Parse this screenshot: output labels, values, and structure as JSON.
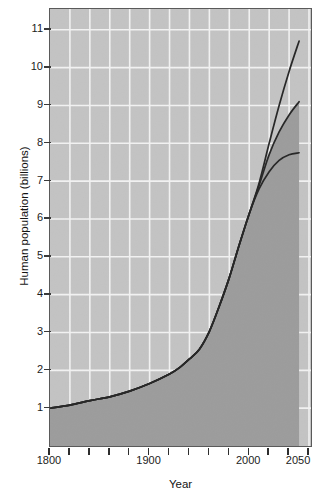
{
  "chart_data": {
    "type": "line",
    "title": "",
    "xlabel": "Year",
    "ylabel": "Human population (billions)",
    "xlim": [
      1800,
      2062
    ],
    "ylim": [
      0.0,
      11.55
    ],
    "grid": true,
    "legend": "none",
    "x_ticks": [
      1800,
      1820,
      1840,
      1860,
      1880,
      1900,
      1920,
      1940,
      1960,
      1980,
      2000,
      2020,
      2040,
      2060
    ],
    "x_tick_labels": [
      "1800",
      "",
      "",
      "",
      "",
      "1900",
      "",
      "",
      "",
      "",
      "2000",
      "",
      "",
      ""
    ],
    "x_major_labels": [
      {
        "value": 1800,
        "label": "1800"
      },
      {
        "value": 1900,
        "label": "1900"
      },
      {
        "value": 2000,
        "label": "2000"
      },
      {
        "value": 2050,
        "label": "2050"
      }
    ],
    "y_ticks": [
      1,
      2,
      3,
      4,
      5,
      6,
      7,
      8,
      9,
      10,
      11
    ],
    "y_tick_labels": [
      "1",
      "2",
      "3",
      "4",
      "5",
      "6",
      "7",
      "8",
      "9",
      "10",
      "11"
    ],
    "shaded_area": {
      "label": "area-under-historical-and-medium-curve",
      "color": "#9c9c9c"
    },
    "plot_background": "#c3c3c3",
    "gridline_color": "#f2f2f2",
    "line_color": "#262626",
    "projection_start_year": 2000,
    "series": [
      {
        "name": "high-projection",
        "end_year": 2050,
        "end_value": 10.7,
        "x": [
          1800,
          1820,
          1840,
          1860,
          1880,
          1900,
          1920,
          1930,
          1940,
          1950,
          1960,
          1970,
          1980,
          1990,
          2000,
          2010,
          2020,
          2030,
          2040,
          2050
        ],
        "y": [
          1.0,
          1.08,
          1.2,
          1.3,
          1.45,
          1.65,
          1.9,
          2.07,
          2.3,
          2.56,
          3.03,
          3.7,
          4.45,
          5.32,
          6.14,
          6.96,
          8.0,
          9.0,
          9.9,
          10.7
        ]
      },
      {
        "name": "medium-projection",
        "end_year": 2050,
        "end_value": 9.1,
        "x": [
          1800,
          1820,
          1840,
          1860,
          1880,
          1900,
          1920,
          1930,
          1940,
          1950,
          1960,
          1970,
          1980,
          1990,
          2000,
          2010,
          2020,
          2030,
          2040,
          2050
        ],
        "y": [
          1.0,
          1.08,
          1.2,
          1.3,
          1.45,
          1.65,
          1.9,
          2.07,
          2.3,
          2.56,
          3.03,
          3.7,
          4.45,
          5.32,
          6.14,
          6.9,
          7.7,
          8.3,
          8.75,
          9.1
        ]
      },
      {
        "name": "low-projection",
        "end_year": 2050,
        "end_value": 7.75,
        "x": [
          1800,
          1820,
          1840,
          1860,
          1880,
          1900,
          1920,
          1930,
          1940,
          1950,
          1960,
          1970,
          1980,
          1990,
          2000,
          2010,
          2020,
          2030,
          2040,
          2050
        ],
        "y": [
          1.0,
          1.08,
          1.2,
          1.3,
          1.45,
          1.65,
          1.9,
          2.07,
          2.3,
          2.56,
          3.03,
          3.7,
          4.45,
          5.32,
          6.14,
          6.8,
          7.25,
          7.55,
          7.7,
          7.75
        ]
      }
    ]
  }
}
